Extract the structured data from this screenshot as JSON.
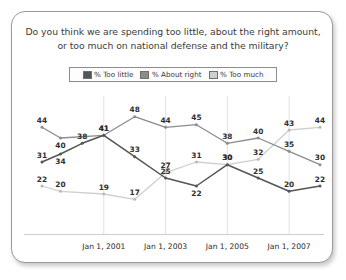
{
  "card": {
    "title": "Do you think we are spending too little, about the right amount, or too much on national defense and the military?"
  },
  "legend": {
    "items": [
      {
        "label": "% Too little",
        "color": "#555555"
      },
      {
        "label": "% About right",
        "color": "#8c8c8c"
      },
      {
        "label": "% Too much",
        "color": "#cfcfcf"
      }
    ]
  },
  "chart_data": {
    "type": "line",
    "title": "Do you think we are spending too little, about the right amount, or too much on national defense and the military?",
    "xlabel": "",
    "ylabel": "",
    "ylim": [
      10,
      52
    ],
    "grid": true,
    "legend_position": "top",
    "x": [
      1999,
      1999.6,
      2000.3,
      2001,
      2002,
      2003,
      2004,
      2005,
      2006,
      2007,
      2008
    ],
    "tick_labels": [
      "Jan 1, 2001",
      "Jan 1, 2003",
      "Jan 1, 2005",
      "Jan 1, 2007"
    ],
    "tick_x": [
      2001,
      2003,
      2005,
      2007
    ],
    "series": [
      {
        "name": "% Too little",
        "color": "#555555",
        "values": [
          31,
          34,
          38,
          41,
          33,
          25,
          22,
          30,
          25,
          20,
          22
        ],
        "labels": [
          "31",
          "34",
          "38",
          "41",
          "33",
          "25",
          "22",
          "30",
          "25",
          "20",
          "22"
        ]
      },
      {
        "name": "% About right",
        "color": "#8c8c8c",
        "values": [
          44,
          40,
          null,
          41,
          48,
          44,
          45,
          38,
          40,
          35,
          30
        ],
        "labels": [
          "44",
          "40",
          "",
          "41",
          "48",
          "44",
          "45",
          "38",
          "40",
          "35",
          "30"
        ]
      },
      {
        "name": "% Too much",
        "color": "#cfcfcf",
        "values": [
          22,
          20,
          null,
          19,
          17,
          27,
          31,
          30,
          32,
          43,
          44
        ],
        "labels": [
          "22",
          "20",
          "",
          "19",
          "17",
          "27",
          "31",
          "30",
          "32",
          "43",
          "44"
        ]
      }
    ]
  }
}
